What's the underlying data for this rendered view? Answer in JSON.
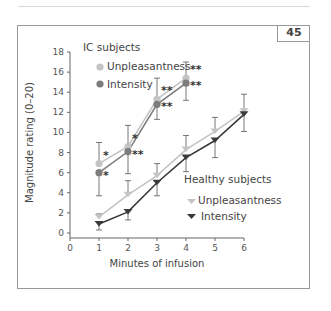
{
  "page": {
    "badge": "45"
  },
  "chart_data": {
    "type": "line",
    "title": "",
    "xlabel": "Minutes of infusion",
    "ylabel": "Magnitude rating (0–20)",
    "xlim": [
      0,
      6
    ],
    "ylim": [
      0,
      18
    ],
    "xticks": [
      0,
      1,
      2,
      3,
      4,
      5,
      6
    ],
    "yticks": [
      0,
      2,
      4,
      6,
      8,
      10,
      12,
      14,
      16,
      18
    ],
    "grid": false,
    "groups": [
      {
        "name": "IC subjects",
        "legend_position": "top-left"
      },
      {
        "name": "Healthy subjects",
        "legend_position": "center-right"
      }
    ],
    "series": [
      {
        "name": "Unpleasantness",
        "group": "IC subjects",
        "marker": "circle",
        "color": "#c4c4c4",
        "x": [
          1,
          2,
          3,
          4
        ],
        "y": [
          6.9,
          8.6,
          13.3,
          15.4
        ],
        "err_upper": [
          9.0,
          10.7,
          15.4,
          17.0
        ],
        "significance": [
          "*",
          "*",
          "**",
          "**"
        ]
      },
      {
        "name": "Intensity",
        "group": "IC subjects",
        "marker": "circle",
        "color": "#7c7c7c",
        "x": [
          1,
          2,
          3,
          4
        ],
        "y": [
          6.0,
          8.1,
          12.8,
          14.9
        ],
        "err_lower": [
          3.7,
          5.9,
          11.3,
          13.2
        ],
        "significance": [
          "*",
          "**",
          "**",
          "**"
        ]
      },
      {
        "name": "Unpleasantness",
        "group": "Healthy subjects",
        "marker": "triangle-down",
        "color": "#c4c4c4",
        "x": [
          1,
          2,
          3,
          4,
          5,
          6
        ],
        "y": [
          1.6,
          3.8,
          5.7,
          8.3,
          10.1,
          12.1
        ],
        "err_upper": [
          1.9,
          5.2,
          6.9,
          9.7,
          11.5,
          13.8
        ]
      },
      {
        "name": "Intensity",
        "group": "Healthy subjects",
        "marker": "triangle-down",
        "color": "#3a3a3a",
        "x": [
          1,
          2,
          3,
          4,
          5,
          6
        ],
        "y": [
          0.9,
          2.1,
          5.0,
          7.5,
          9.2,
          11.8
        ],
        "err_lower": [
          0.3,
          1.3,
          3.7,
          6.1,
          7.5,
          10.1
        ]
      }
    ]
  }
}
